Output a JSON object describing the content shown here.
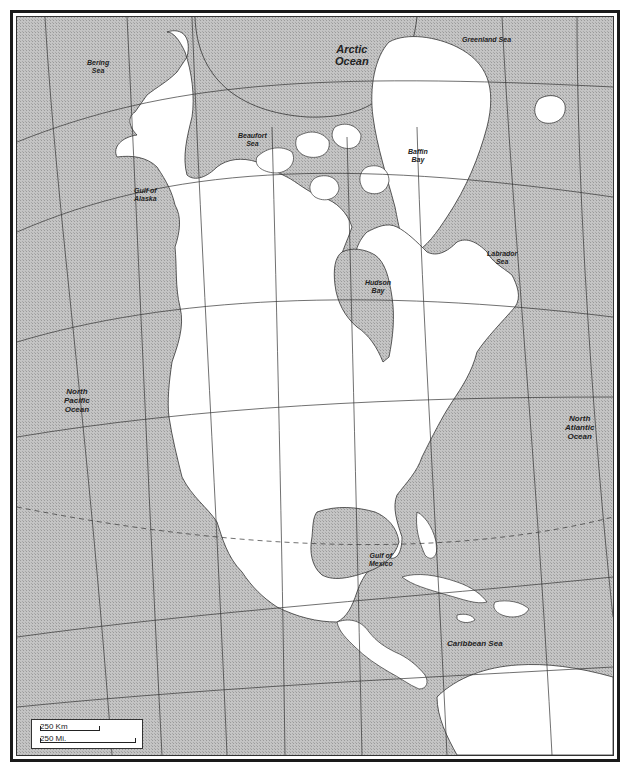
{
  "map": {
    "title": "North America outline map",
    "colors": {
      "water": "#b9b9b9",
      "land": "#ffffff",
      "graticule": "#333333",
      "frame": "#1a1a1a",
      "label": "#222222"
    },
    "water_labels": [
      {
        "id": "bering-sea",
        "text": "Bering\nSea",
        "line1": "Bering",
        "line2": "Sea"
      },
      {
        "id": "arctic-ocean",
        "line1": "Arctic",
        "line2": "Ocean"
      },
      {
        "id": "greenland-sea",
        "line1": "Greenland Sea"
      },
      {
        "id": "beaufort-sea",
        "line1": "Beaufort",
        "line2": "Sea"
      },
      {
        "id": "baffin-bay",
        "line1": "Baffin",
        "line2": "Bay"
      },
      {
        "id": "gulf-of-alaska",
        "line1": "Gulf of",
        "line2": "Alaska"
      },
      {
        "id": "labrador-sea",
        "line1": "Labrador",
        "line2": "Sea"
      },
      {
        "id": "hudson-bay",
        "line1": "Hudson",
        "line2": "Bay"
      },
      {
        "id": "north-pacific-ocean",
        "line1": "North",
        "line2": "Pacific",
        "line3": "Ocean"
      },
      {
        "id": "north-atlantic-ocean",
        "line1": "North",
        "line2": "Atlantic",
        "line3": "Ocean"
      },
      {
        "id": "gulf-of-mexico",
        "line1": "Gulf of",
        "line2": "Mexico"
      },
      {
        "id": "caribbean-sea",
        "line1": "Caribbean Sea"
      }
    ],
    "scale_bar": {
      "km_label": "250 Km",
      "mi_label": "250 Mi."
    }
  }
}
